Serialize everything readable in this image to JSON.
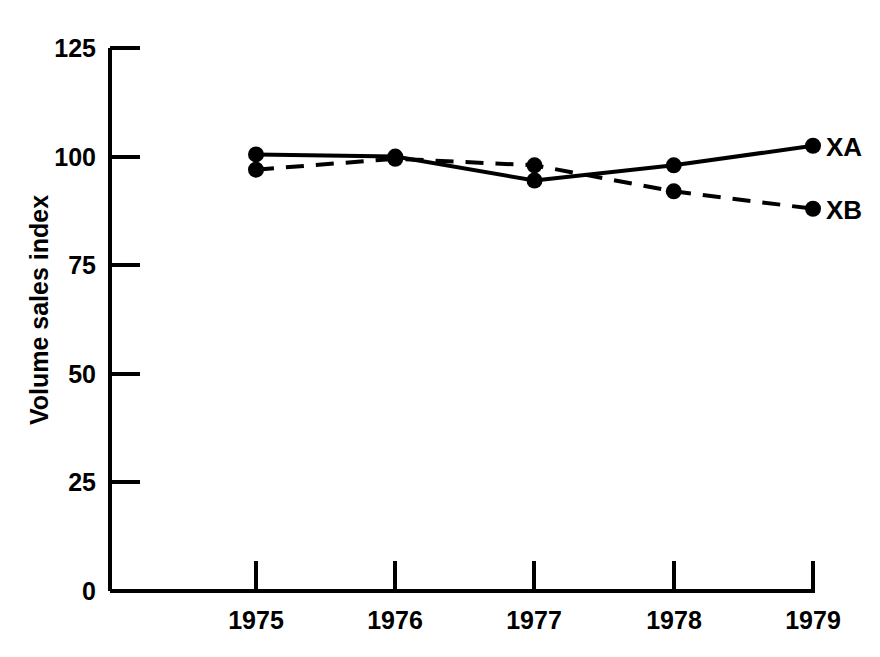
{
  "chart_data": {
    "type": "line",
    "title": "",
    "xlabel": "",
    "ylabel": "Volume sales index",
    "categories": [
      "1975",
      "1976",
      "1977",
      "1978",
      "1979"
    ],
    "x": [
      1975,
      1976,
      1977,
      1978,
      1979
    ],
    "xlim": [
      1975,
      1979
    ],
    "ylim": [
      0,
      125
    ],
    "yticks": [
      0,
      25,
      50,
      75,
      100,
      125
    ],
    "ytick_labels": [
      "0",
      "25",
      "50",
      "75",
      "100",
      "125"
    ],
    "grid": false,
    "legend_position": "right-inline-end-of-line",
    "series": [
      {
        "name": "XA",
        "label": "XA",
        "style": "solid",
        "color": "#000000",
        "marker": "filled-circle",
        "values": [
          100.5,
          100,
          94.5,
          98,
          102.5
        ]
      },
      {
        "name": "XB",
        "label": "XB",
        "style": "dashed",
        "color": "#000000",
        "marker": "filled-circle",
        "values": [
          97,
          99.5,
          98,
          92,
          88
        ]
      }
    ]
  },
  "axes": {
    "y_axis_title": "Volume sales index",
    "y_tick_labels": [
      "125",
      "100",
      "75",
      "50",
      "25",
      "0"
    ],
    "x_tick_labels": [
      "1975",
      "1976",
      "1977",
      "1978",
      "1979"
    ]
  },
  "legend": {
    "xa_label": "XA",
    "xb_label": "XB"
  }
}
